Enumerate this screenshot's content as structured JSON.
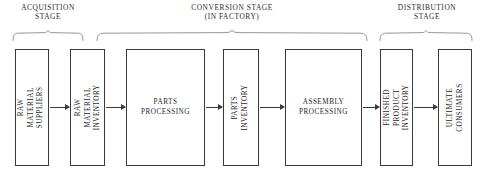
{
  "diagram": {
    "title_visible": false,
    "stages": [
      {
        "id": "acquisition",
        "label": "ACQUISITION\nSTAGE",
        "brace": {
          "x": 12,
          "y": 30,
          "width": 72,
          "height": 10
        },
        "label_box": {
          "x": 4,
          "y": 3,
          "width": 88
        }
      },
      {
        "id": "conversion",
        "label": "CONVERSION STAGE\n(IN FACTORY)",
        "brace": {
          "x": 96,
          "y": 30,
          "width": 272,
          "height": 10
        },
        "label_box": {
          "x": 142,
          "y": 3,
          "width": 180
        }
      },
      {
        "id": "distribution",
        "label": "DISTRIBUTION\nSTAGE",
        "brace": {
          "x": 379,
          "y": 30,
          "width": 94,
          "height": 10
        },
        "label_box": {
          "x": 381,
          "y": 3,
          "width": 92
        }
      }
    ],
    "nodes": [
      {
        "id": "raw-material-suppliers",
        "label": "RAW MATERIAL\nSUPPLIERS",
        "orientation": "vertical",
        "box": {
          "x": 15,
          "y": 49,
          "width": 34,
          "height": 117
        }
      },
      {
        "id": "raw-material-inventory",
        "label": "RAW MATERIAL\nINVENTORY",
        "orientation": "vertical",
        "box": {
          "x": 70,
          "y": 49,
          "width": 35,
          "height": 117
        }
      },
      {
        "id": "parts-processing",
        "label": "PARTS\nPROCESSING",
        "orientation": "horizontal",
        "box": {
          "x": 126,
          "y": 49,
          "width": 79,
          "height": 117
        }
      },
      {
        "id": "parts-inventory",
        "label": "PARTS\nINVENTORY",
        "orientation": "vertical",
        "box": {
          "x": 223,
          "y": 49,
          "width": 36,
          "height": 117
        }
      },
      {
        "id": "assembly-processing",
        "label": "ASSEMBLY\nPROCESSING",
        "orientation": "horizontal",
        "box": {
          "x": 285,
          "y": 49,
          "width": 77,
          "height": 117
        }
      },
      {
        "id": "finished-product-inventory",
        "label": "FINISHED PRODUCT\nINVENTORY",
        "orientation": "vertical",
        "box": {
          "x": 380,
          "y": 49,
          "width": 33,
          "height": 117
        }
      },
      {
        "id": "ultimate-consumers",
        "label": "ULTIMATE CONSUMERS",
        "orientation": "vertical",
        "box": {
          "x": 438,
          "y": 49,
          "width": 34,
          "height": 117
        }
      }
    ],
    "arrows": [
      {
        "id": "suppliers-to-rm-inventory",
        "x": 50,
        "y": 107,
        "width": 19
      },
      {
        "id": "rm-inventory-to-parts-processing",
        "x": 106,
        "y": 107,
        "width": 19
      },
      {
        "id": "parts-processing-to-parts-inventory",
        "x": 206,
        "y": 107,
        "width": 16
      },
      {
        "id": "parts-inventory-to-assembly",
        "x": 260,
        "y": 107,
        "width": 24
      },
      {
        "id": "assembly-to-fp-inventory",
        "x": 363,
        "y": 107,
        "width": 16
      },
      {
        "id": "fp-inventory-to-consumers",
        "x": 414,
        "y": 107,
        "width": 23
      }
    ],
    "colors": {
      "box_border": "#3a3a3a",
      "brace_stroke": "#8a8a8a",
      "text": "#1f1f1f",
      "label_text": "#2b2b2b",
      "background": "#ffffff"
    }
  }
}
